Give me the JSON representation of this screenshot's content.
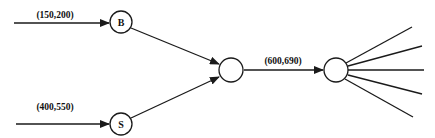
{
  "diagram": {
    "colors": {
      "stroke": "#1a1a1a",
      "background": "#ffffff"
    },
    "nodes": {
      "b": {
        "label": "B",
        "cx": 121,
        "cy": 22,
        "r": 11
      },
      "s": {
        "label": "S",
        "cx": 121,
        "cy": 124,
        "r": 11
      },
      "merge": {
        "label": "",
        "cx": 231,
        "cy": 70,
        "r": 13
      },
      "split": {
        "label": "",
        "cx": 336,
        "cy": 70,
        "r": 12
      }
    },
    "edges": {
      "in_b": {
        "label": "(150,200)"
      },
      "in_s": {
        "label": "(400,550)"
      },
      "merge_to_split": {
        "label": "(600,690)"
      }
    },
    "fan_out_count": 5
  }
}
